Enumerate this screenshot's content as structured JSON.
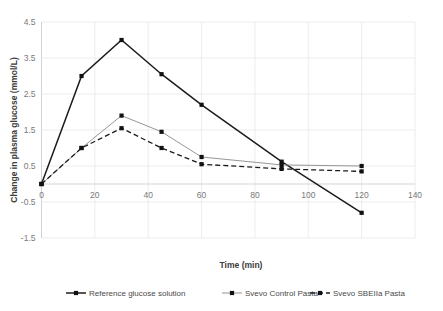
{
  "chart_data": {
    "type": "line",
    "title": "",
    "xlabel": "Time (min)",
    "ylabel": "Change in plasma glucose (mmol/L)",
    "x": [
      0,
      15,
      30,
      45,
      60,
      90,
      120
    ],
    "xlim": [
      0,
      140
    ],
    "ylim": [
      -1.5,
      4.5
    ],
    "xticks": [
      "0",
      "20",
      "40",
      "60",
      "80",
      "100",
      "120",
      "140"
    ],
    "xtick_values": [
      0,
      20,
      40,
      60,
      80,
      100,
      120,
      140
    ],
    "yticks": [
      "-1.5",
      "-0.5",
      "0.5",
      "1.5",
      "2.5",
      "3.5",
      "4.5"
    ],
    "ytick_values": [
      -1.5,
      -0.5,
      0.5,
      1.5,
      2.5,
      3.5,
      4.5
    ],
    "grid": true,
    "legend_position": "bottom",
    "series": [
      {
        "name": "Reference glucose solution",
        "style": "solid",
        "color": "#1c1c1c",
        "marker": "square",
        "values": [
          0,
          3.0,
          4.0,
          3.05,
          2.2,
          0.62,
          -0.8
        ]
      },
      {
        "name": "Svevo Control Pasta",
        "style": "dotted-thin",
        "color": "#8a8a8a",
        "marker": "square",
        "values": [
          0,
          1.0,
          1.9,
          1.45,
          0.75,
          0.53,
          0.5
        ]
      },
      {
        "name": "Svevo SBEIIa Pasta",
        "style": "dashed",
        "color": "#1c1c1c",
        "marker": "square",
        "values": [
          0,
          1.0,
          1.55,
          1.0,
          0.55,
          0.42,
          0.35
        ]
      }
    ]
  },
  "axes": {
    "x_title": "Time (min)",
    "y_title": "Change in plasma glucose (mmol/L)"
  },
  "legend": {
    "items": [
      {
        "label": "Reference glucose solution"
      },
      {
        "label": "Svevo Control Pasta"
      },
      {
        "label": "Svevo SBEIIa Pasta"
      }
    ]
  }
}
